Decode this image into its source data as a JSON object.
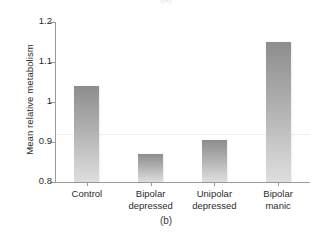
{
  "figure": {
    "caption_top": "(a)",
    "caption_bottom": "(b)"
  },
  "chart_data": {
    "type": "bar",
    "title": "",
    "subtitle": "",
    "xlabel": "",
    "ylabel": "Mean relative metabolism",
    "categories": [
      "Control",
      "Bipolar\ndepressed",
      "Unipolar\ndepressed",
      "Bipolar\nmanic"
    ],
    "category_labels_flat": [
      "Control",
      "Bipolar depressed",
      "Unipolar depressed",
      "Bipolar manic"
    ],
    "values": [
      1.04,
      0.87,
      0.905,
      1.15
    ],
    "ylim": [
      0.8,
      1.2
    ],
    "yticks": [
      0.8,
      0.9,
      1.0,
      1.1,
      1.2
    ],
    "ytick_labels": [
      "0.8",
      "0.9",
      "1",
      "1.1",
      "1.2"
    ],
    "gridlines": [
      0.92
    ],
    "grid": false,
    "legend": null,
    "legend_position": "none",
    "bar_color_top": "#8d8d8d",
    "bar_color_bottom": "#dedede",
    "axis_color": "#9a9a9a",
    "gridline_color": "#f0efef"
  }
}
